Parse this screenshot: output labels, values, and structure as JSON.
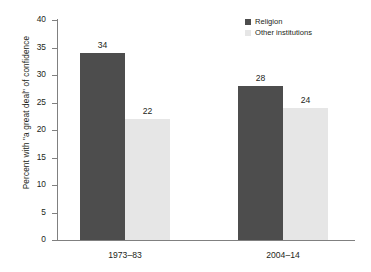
{
  "chart_data": {
    "type": "bar",
    "title": "",
    "subtitle": "",
    "xlabel": "",
    "ylabel": "Percent with \"a great deal\" of confidence",
    "categories": [
      "1973–83",
      "2004–14"
    ],
    "series": [
      {
        "name": "Religion",
        "values": [
          34,
          28
        ],
        "color": "#4d4d4d"
      },
      {
        "name": "Other institutions",
        "values": [
          22,
          24
        ],
        "color": "#e6e6e6"
      }
    ],
    "bars": [
      {
        "group": "1973–83",
        "series": "Religion",
        "value": 34,
        "label": "34",
        "shade": "dark"
      },
      {
        "group": "1973–83",
        "series": "Other institutions",
        "value": 28,
        "label": "28",
        "shade": "light"
      },
      {
        "group": "2004–14",
        "series": "Religion",
        "value": 22,
        "label": "22",
        "shade": "dark"
      },
      {
        "group": "2004–14",
        "series": "Other institutions",
        "value": 24,
        "label": "24",
        "shade": "light"
      }
    ],
    "ylim": [
      0,
      40
    ],
    "y_ticks": [
      40,
      35,
      30,
      25,
      20,
      15,
      10,
      5,
      0
    ],
    "y_tick_labels": [
      "40",
      "35",
      "30",
      "25",
      "20",
      "15",
      "10",
      "5",
      "0"
    ],
    "grid": false,
    "legend_position": "top-right",
    "legend": [
      "Religion",
      "Other institutions"
    ]
  },
  "axis": {
    "y_title": "Percent with \"a great deal\" of confidence"
  },
  "colors": {
    "dark_bar": "#4d4d4d",
    "light_bar": "#e6e6e6",
    "axis": "#808080",
    "text": "#231f20",
    "background": "#ffffff"
  }
}
